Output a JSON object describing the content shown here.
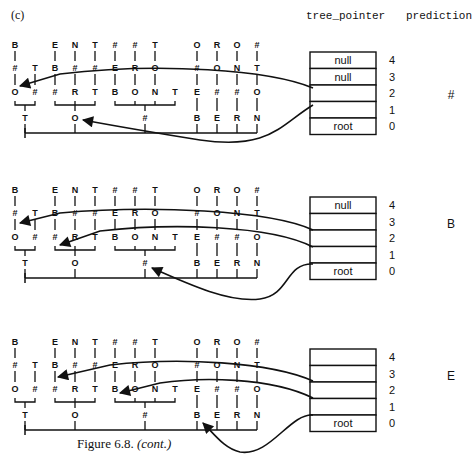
{
  "panel_label": "(c)",
  "headers": {
    "tree_pointer": "tree_pointer",
    "prediction": "prediction"
  },
  "caption": {
    "main": "Figure 6.8. ",
    "note": "(cont.)"
  },
  "tree": {
    "columns": [
      {
        "x": 15,
        "chars": [
          "B",
          "#",
          "O"
        ]
      },
      {
        "x": 35,
        "chars": [
          "",
          "T",
          "#"
        ]
      },
      {
        "x": 55,
        "chars": [
          "E",
          "B",
          "#"
        ]
      },
      {
        "x": 75,
        "chars": [
          "N",
          "#",
          "R"
        ]
      },
      {
        "x": 95,
        "chars": [
          "T",
          "#",
          "T"
        ]
      },
      {
        "x": 115,
        "chars": [
          "#",
          "E",
          "B"
        ]
      },
      {
        "x": 135,
        "chars": [
          "#",
          "R",
          "O"
        ]
      },
      {
        "x": 155,
        "chars": [
          "T",
          "O",
          "N"
        ]
      },
      {
        "x": 175,
        "chars": [
          "",
          "",
          "T"
        ]
      },
      {
        "x": 197,
        "chars": [
          "O",
          "#",
          "E",
          "B"
        ]
      },
      {
        "x": 217,
        "chars": [
          "R",
          "O",
          "#",
          "E"
        ]
      },
      {
        "x": 237,
        "chars": [
          "O",
          "N",
          "#",
          "R"
        ]
      },
      {
        "x": 257,
        "chars": [
          "#",
          "T",
          "O",
          "N"
        ]
      }
    ],
    "groups": [
      {
        "from": 15,
        "to": 35,
        "x": 25,
        "label": "T"
      },
      {
        "from": 55,
        "to": 95,
        "x": 75,
        "label": "O"
      },
      {
        "from": 115,
        "to": 175,
        "x": 145,
        "label": "#"
      }
    ],
    "root_line": {
      "from": 25,
      "to": 257
    }
  },
  "panels": [
    {
      "offset_y": 0,
      "stack": [
        {
          "index": "4",
          "value": "null"
        },
        {
          "index": "3",
          "value": "null"
        },
        {
          "index": "2",
          "value": ""
        },
        {
          "index": "1",
          "value": ""
        },
        {
          "index": "0",
          "value": "root"
        }
      ],
      "prediction": "#"
    },
    {
      "offset_y": 145,
      "stack": [
        {
          "index": "4",
          "value": "null"
        },
        {
          "index": "3",
          "value": ""
        },
        {
          "index": "2",
          "value": ""
        },
        {
          "index": "1",
          "value": ""
        },
        {
          "index": "0",
          "value": "root"
        }
      ],
      "prediction": "B"
    },
    {
      "offset_y": 297,
      "stack": [
        {
          "index": "4",
          "value": ""
        },
        {
          "index": "3",
          "value": ""
        },
        {
          "index": "2",
          "value": ""
        },
        {
          "index": "1",
          "value": ""
        },
        {
          "index": "0",
          "value": "root"
        }
      ],
      "prediction": "E"
    }
  ]
}
